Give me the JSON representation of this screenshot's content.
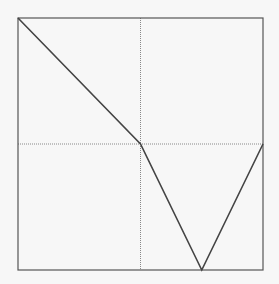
{
  "chart_data": {
    "type": "line",
    "title": "",
    "xlabel": "",
    "ylabel": "",
    "x": [
      0,
      1,
      1.5,
      2
    ],
    "series": [
      {
        "name": "",
        "values": [
          1,
          0,
          -1,
          0
        ]
      }
    ],
    "xlim": [
      0,
      2
    ],
    "ylim": [
      -1,
      1
    ],
    "grid": {
      "x": [
        1
      ],
      "y": [
        0
      ],
      "style": "dotted"
    },
    "legend": "none",
    "colors": {
      "line": "#444444",
      "frame": "#555555",
      "grid": "#888888",
      "background": "#f7f7f7"
    }
  }
}
